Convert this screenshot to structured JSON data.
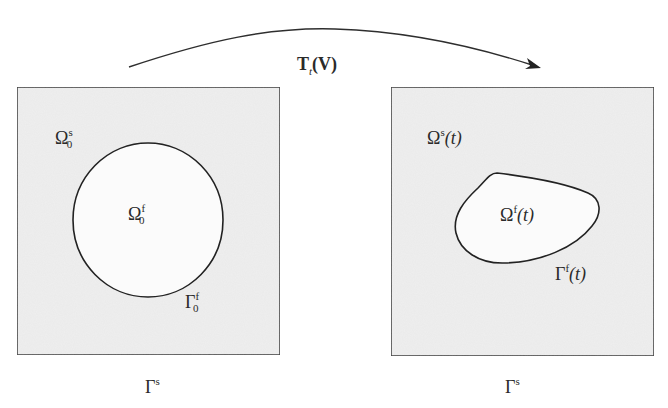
{
  "figure": {
    "type": "domain-deformation-schematic",
    "colors": {
      "background": "#ffffff",
      "solid_region_fill": "#efefef",
      "fluid_region_fill": "#fbfbfb",
      "stroke": "#2e2e2e"
    },
    "transform_arrow": {
      "label_base": "T",
      "label_sub": "t",
      "label_arg": "(V)",
      "from": [
        129,
        67
      ],
      "peak": [
        335,
        29
      ],
      "to": [
        540,
        68
      ]
    },
    "left_panel": {
      "box": {
        "x": 17,
        "y": 87,
        "width": 263,
        "height": 268
      },
      "solid_label": {
        "base": "Ω",
        "sup": "s",
        "sub": "0"
      },
      "fluid_label": {
        "base": "Ω",
        "sup": "f",
        "sub": "0"
      },
      "interface_label": {
        "base": "Γ",
        "sup": "f",
        "sub": "0"
      },
      "boundary_label": {
        "base": "Γ",
        "sup": "s"
      },
      "inclusion": {
        "shape": "circle",
        "cx": 148,
        "cy": 220,
        "rx": 75,
        "ry": 77
      }
    },
    "right_panel": {
      "box": {
        "x": 391,
        "y": 87,
        "width": 263,
        "height": 269
      },
      "solid_label": {
        "base": "Ω",
        "sup": "s",
        "arg": "(t)"
      },
      "fluid_label": {
        "base": "Ω",
        "sup": "f",
        "arg": "(t)"
      },
      "interface_label": {
        "base": "Γ",
        "sup": "f",
        "arg": "(t)"
      },
      "boundary_label": {
        "base": "Γ",
        "sup": "s"
      },
      "inclusion": {
        "shape": "deformed-blob"
      }
    }
  }
}
